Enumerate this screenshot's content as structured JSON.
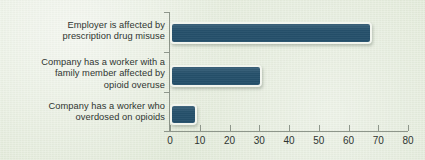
{
  "chart_data": {
    "type": "bar",
    "orientation": "horizontal",
    "title": "",
    "xlabel": "",
    "ylabel": "",
    "xlim": [
      0,
      80
    ],
    "xticks": [
      0,
      10,
      20,
      30,
      40,
      50,
      60,
      70,
      80
    ],
    "tick_labels": [
      "0",
      "10",
      "20",
      "30",
      "40",
      "50",
      "60",
      "70",
      "80"
    ],
    "grid": false,
    "legend": false,
    "categories": [
      "Employer is affected by\nprescription drug misuse",
      "Company has a worker with a\nfamily member affected by\nopioid overuse",
      "Company has a worker who\noverdosed on opioids"
    ],
    "values": [
      68,
      31,
      9
    ],
    "colors": {
      "bar_fill": "#25506b",
      "bar_border": "#f2f5ee",
      "background": "#e4ebdd",
      "axis": "#8e968b",
      "text": "#2f3531"
    }
  }
}
